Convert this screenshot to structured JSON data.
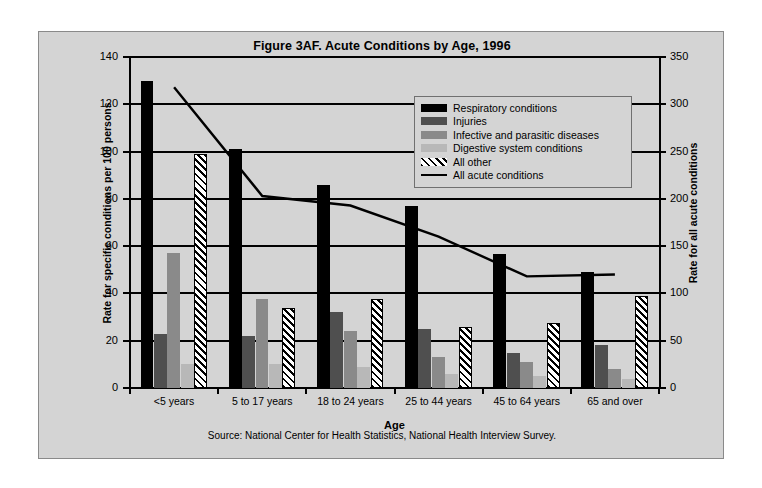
{
  "chart_data": {
    "type": "bar",
    "title": "Figure 3AF. Acute Conditions by Age, 1996",
    "xlabel": "Age",
    "ylabel": "Rate for specific conditions per 100 persons",
    "ylabel_secondary": "Rate for all acute conditions",
    "categories": [
      "<5 years",
      "5 to 17 years",
      "18 to 24 years",
      "25 to 44 years",
      "45 to 64 years",
      "65 and over"
    ],
    "ylim": [
      0,
      140
    ],
    "yticks": [
      0,
      20,
      40,
      60,
      80,
      100,
      120,
      140
    ],
    "ylim_secondary": [
      0,
      350
    ],
    "yticks_secondary": [
      0,
      50,
      100,
      150,
      200,
      250,
      300,
      350
    ],
    "grid": true,
    "legend_position": "upper-right",
    "series": [
      {
        "name": "Respiratory conditions",
        "type": "bar",
        "axis": "left",
        "color": "#000000",
        "values": [
          130,
          101,
          86,
          77,
          56.5,
          49
        ]
      },
      {
        "name": "Injuries",
        "type": "bar",
        "axis": "left",
        "color": "#4f4f4f",
        "values": [
          23,
          22,
          32,
          25,
          15,
          18
        ]
      },
      {
        "name": "Infective and parasitic diseases",
        "type": "bar",
        "axis": "left",
        "color": "#8a8a8a",
        "values": [
          57,
          37.5,
          24,
          13,
          11,
          8
        ]
      },
      {
        "name": "Digestive system conditions",
        "type": "bar",
        "axis": "left",
        "color": "#b8b8b8",
        "values": [
          10,
          10,
          9,
          6,
          5,
          4
        ]
      },
      {
        "name": "All other",
        "type": "bar",
        "axis": "left",
        "color": "#ffffff",
        "hatch": "diagonal",
        "values": [
          99,
          34,
          37.5,
          26,
          27.5,
          39
        ]
      },
      {
        "name": "All acute conditions",
        "type": "line",
        "axis": "right",
        "color": "#000000",
        "values": [
          318,
          203,
          193,
          160,
          118,
          120
        ]
      }
    ],
    "source": "Source: National Center for Health Statistics, National Health Interview Survey."
  }
}
